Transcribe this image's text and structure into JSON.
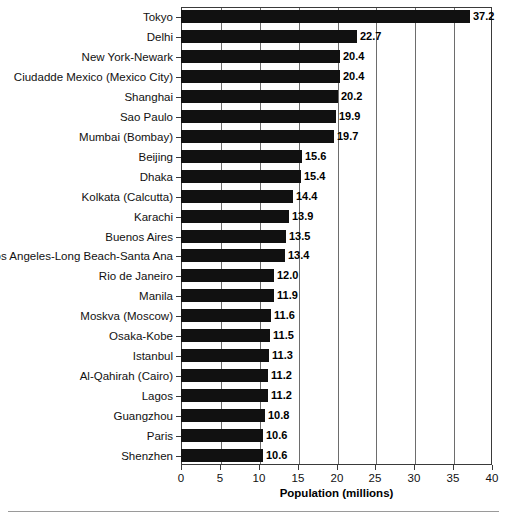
{
  "chart_data": {
    "type": "bar",
    "orientation": "horizontal",
    "title": "",
    "xlabel": "Population (millions)",
    "ylabel": "",
    "xlim": [
      0,
      40
    ],
    "xticks": [
      0,
      5,
      10,
      15,
      20,
      25,
      30,
      35,
      40
    ],
    "grid": "vertical",
    "legend": "none",
    "bar_color": "#111111",
    "categories": [
      "Tokyo",
      "Delhi",
      "New York-Newark",
      "Ciudadde Mexico (Mexico City)",
      "Shanghai",
      "Sao Paulo",
      "Mumbai (Bombay)",
      "Beijing",
      "Dhaka",
      "Kolkata (Calcutta)",
      "Karachi",
      "Buenos Aires",
      "Los Angeles-Long Beach-Santa Ana",
      "Rio de Janeiro",
      "Manila",
      "Moskva (Moscow)",
      "Osaka-Kobe",
      "Istanbul",
      "Al-Qahirah (Cairo)",
      "Lagos",
      "Guangzhou",
      "Paris",
      "Shenzhen"
    ],
    "values": [
      37.2,
      22.7,
      20.4,
      20.4,
      20.2,
      19.9,
      19.7,
      15.6,
      15.4,
      14.4,
      13.9,
      13.5,
      13.4,
      12.0,
      11.9,
      11.6,
      11.5,
      11.3,
      11.2,
      11.2,
      10.8,
      10.6,
      10.6
    ],
    "value_labels": [
      "37.2",
      "22.7",
      "20.4",
      "20.4",
      "20.2",
      "19.9",
      "19.7",
      "15.6",
      "15.4",
      "14.4",
      "13.9",
      "13.5",
      "13.4",
      "12.0",
      "11.9",
      "11.6",
      "11.5",
      "11.3",
      "11.2",
      "11.2",
      "10.8",
      "10.6",
      "10.6"
    ]
  }
}
